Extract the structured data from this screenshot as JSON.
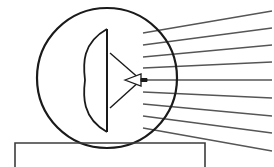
{
  "diagram": {
    "type": "line-drawing",
    "background_color": "#ffffff",
    "canvas": {
      "width": 274,
      "height": 167
    },
    "stroke_colors": {
      "outline_dark": "#1a1a1a",
      "reflector": "#2b2b2b",
      "ray": "#565656",
      "base": "#3c3c3c"
    },
    "elements": {
      "radome": {
        "label": "radome-circle",
        "shape": "circle",
        "center_x": 107,
        "center_y": 78,
        "radius": 70,
        "stroke_width": 2.2
      },
      "reflector": {
        "label": "parabolic-reflector-dish",
        "aperture_top_x": 107,
        "aperture_top_y": 29,
        "aperture_bottom_x": 107,
        "aperture_bottom_y": 132,
        "vertex_x": 85,
        "vertex_y": 80,
        "stroke_width": 1.8
      },
      "feed_support": {
        "label": "feed-support-struts",
        "upper_start_x": 110,
        "upper_start_y": 53,
        "lower_start_x": 110,
        "lower_start_y": 108,
        "apex_x": 141,
        "apex_y": 80,
        "stroke_width": 1.4
      },
      "feed_horn": {
        "label": "feed-horn",
        "throat_x": 125,
        "throat_y": 80,
        "mouth_x": 141,
        "mouth_y": 80,
        "half_height": 6,
        "stub_length": 6,
        "stub_thickness": 3,
        "stroke_width": 1.3
      },
      "base": {
        "label": "mounting-base",
        "left_x": 15,
        "right_x": 205,
        "top_y": 143,
        "bottom_y": 167,
        "stroke_width": 1.6
      },
      "rays": {
        "label": "radiated-beam-rays",
        "count": 9,
        "origin_x": 143,
        "end_x": 272,
        "stroke_width": 1.5,
        "lines": [
          {
            "id": "ray-1",
            "y_start": 33,
            "y_end": 11
          },
          {
            "id": "ray-2",
            "y_start": 45,
            "y_end": 28
          },
          {
            "id": "ray-3",
            "y_start": 57,
            "y_end": 45
          },
          {
            "id": "ray-4",
            "y_start": 68,
            "y_end": 62
          },
          {
            "id": "ray-5",
            "y_start": 80,
            "y_end": 80
          },
          {
            "id": "ray-6",
            "y_start": 92,
            "y_end": 98
          },
          {
            "id": "ray-7",
            "y_start": 104,
            "y_end": 116
          },
          {
            "id": "ray-8",
            "y_start": 116,
            "y_end": 133
          },
          {
            "id": "ray-9",
            "y_start": 128,
            "y_end": 151
          }
        ]
      }
    }
  }
}
